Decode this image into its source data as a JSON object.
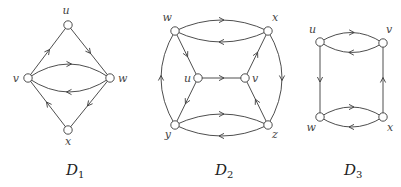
{
  "diagrams": [
    {
      "id": "D1",
      "caption": "D",
      "caption_sub": "1",
      "vertices": [
        {
          "id": "u",
          "label": "u"
        },
        {
          "id": "v",
          "label": "v"
        },
        {
          "id": "w",
          "label": "w"
        },
        {
          "id": "x",
          "label": "x"
        }
      ],
      "arcs": [
        {
          "from": "v",
          "to": "u"
        },
        {
          "from": "u",
          "to": "w"
        },
        {
          "from": "v",
          "to": "w"
        },
        {
          "from": "w",
          "to": "v"
        },
        {
          "from": "w",
          "to": "x"
        },
        {
          "from": "x",
          "to": "v"
        }
      ]
    },
    {
      "id": "D2",
      "caption": "D",
      "caption_sub": "2",
      "vertices": [
        {
          "id": "w",
          "label": "w"
        },
        {
          "id": "x",
          "label": "x"
        },
        {
          "id": "u",
          "label": "u"
        },
        {
          "id": "v",
          "label": "v"
        },
        {
          "id": "y",
          "label": "y"
        },
        {
          "id": "z",
          "label": "z"
        }
      ],
      "arcs": [
        {
          "from": "w",
          "to": "x"
        },
        {
          "from": "x",
          "to": "w"
        },
        {
          "from": "w",
          "to": "u"
        },
        {
          "from": "u",
          "to": "v"
        },
        {
          "from": "v",
          "to": "x"
        },
        {
          "from": "u",
          "to": "y"
        },
        {
          "from": "z",
          "to": "v"
        },
        {
          "from": "y",
          "to": "z"
        },
        {
          "from": "z",
          "to": "y"
        },
        {
          "from": "y",
          "to": "w"
        },
        {
          "from": "x",
          "to": "z"
        }
      ]
    },
    {
      "id": "D3",
      "caption": "D",
      "caption_sub": "3",
      "vertices": [
        {
          "id": "u",
          "label": "u"
        },
        {
          "id": "v",
          "label": "v"
        },
        {
          "id": "w",
          "label": "w"
        },
        {
          "id": "x",
          "label": "x"
        }
      ],
      "arcs": [
        {
          "from": "u",
          "to": "v"
        },
        {
          "from": "v",
          "to": "u"
        },
        {
          "from": "u",
          "to": "w"
        },
        {
          "from": "x",
          "to": "v"
        },
        {
          "from": "w",
          "to": "x"
        },
        {
          "from": "x",
          "to": "w"
        }
      ]
    }
  ]
}
